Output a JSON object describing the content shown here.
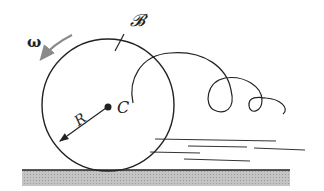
{
  "diagram": {
    "labels": {
      "body": "𝓑",
      "angular_velocity": "ω",
      "radius": "R",
      "center": "C"
    },
    "colors": {
      "stroke": "#222222",
      "omega_arrow": "#8a8a8a",
      "ground_fill": "#b8b8b8"
    }
  }
}
